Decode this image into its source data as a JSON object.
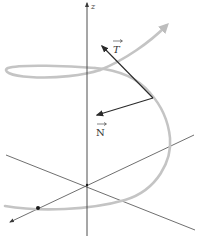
{
  "diagram": {
    "labels": {
      "z_axis": "z",
      "tangent": "T",
      "normal": "N"
    },
    "colors": {
      "axis": "#3a3a3a",
      "curve": "#c4c4c4",
      "vector": "#2a2a2a",
      "label": "#333333",
      "point": "#1a1a1a"
    }
  }
}
